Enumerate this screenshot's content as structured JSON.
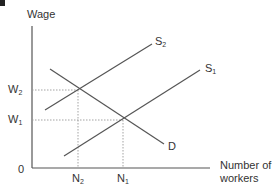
{
  "chart_data": {
    "type": "line",
    "title": "",
    "ylabel": "Wage",
    "xlabel": "Number of workers",
    "origin_label": "0",
    "y_ticks": [
      {
        "label": "W",
        "sub": "2",
        "y": 90
      },
      {
        "label": "W",
        "sub": "1",
        "y": 120
      }
    ],
    "x_ticks": [
      {
        "label": "N",
        "sub": "2",
        "x": 78
      },
      {
        "label": "N",
        "sub": "1",
        "x": 123
      }
    ],
    "series": [
      {
        "name": "D",
        "label": "D",
        "sub": "",
        "points": [
          [
            50,
            69
          ],
          [
            164,
            144
          ]
        ]
      },
      {
        "name": "S2",
        "label": "S",
        "sub": "2",
        "points": [
          [
            45,
            110
          ],
          [
            152,
            44
          ]
        ]
      },
      {
        "name": "S1",
        "label": "S",
        "sub": "1",
        "points": [
          [
            64,
            156
          ],
          [
            200,
            70
          ]
        ]
      }
    ],
    "equilibria": [
      {
        "name": "E2",
        "wage": "W2",
        "workers": "N2",
        "x": 78,
        "y": 90
      },
      {
        "name": "E1",
        "wage": "W1",
        "workers": "N1",
        "x": 123,
        "y": 120
      }
    ],
    "grid": false,
    "guide_lines": "dotted",
    "colors": {
      "axis": "#555555",
      "line": "#555555",
      "guide": "#999999",
      "text": "#333333"
    }
  }
}
